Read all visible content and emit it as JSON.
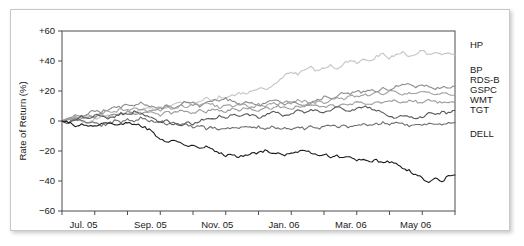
{
  "figure": {
    "background_color": "#ffffff",
    "frame_border_color": "#c8c8c8"
  },
  "chart_data": {
    "type": "line",
    "title": "",
    "subtitle": "",
    "xlabel": "",
    "ylabel": "Rate of Return (%)",
    "ylim": [
      -60,
      60
    ],
    "ytick_labels": [
      "+60",
      "+40",
      "+20",
      "0",
      "-20",
      "-40",
      "-60"
    ],
    "ytick_values": [
      60,
      40,
      20,
      0,
      -20,
      -40,
      -60
    ],
    "xtick_labels": [
      "Jul. 05",
      "Sep. 05",
      "Nov. 05",
      "Jan. 06",
      "Mar. 06",
      "May 06"
    ],
    "xtick_positions": [
      0.055,
      0.225,
      0.395,
      0.565,
      0.735,
      0.9
    ],
    "grid": false,
    "legend_position": "right",
    "x_count": 61,
    "series": [
      {
        "name": "HP",
        "color": "#c4c4c4",
        "legend_y": 48,
        "values": [
          0,
          1,
          2,
          0,
          -1,
          1,
          3,
          4,
          3,
          5,
          6,
          5,
          7,
          9,
          8,
          10,
          9,
          11,
          13,
          12,
          11,
          13,
          15,
          14,
          16,
          15,
          17,
          19,
          18,
          20,
          22,
          21,
          23,
          26,
          30,
          33,
          31,
          34,
          36,
          33,
          35,
          37,
          35,
          38,
          41,
          39,
          42,
          40,
          43,
          45,
          42,
          44,
          46,
          43,
          45,
          47,
          44,
          46,
          44,
          46,
          44
        ]
      },
      {
        "name": "BP",
        "color": "#8c8c8c",
        "legend_y": 73,
        "values": [
          0,
          2,
          4,
          3,
          5,
          7,
          6,
          8,
          10,
          9,
          11,
          10,
          12,
          11,
          9,
          8,
          10,
          9,
          11,
          13,
          12,
          10,
          12,
          14,
          13,
          15,
          13,
          11,
          13,
          12,
          10,
          12,
          14,
          13,
          11,
          13,
          12,
          10,
          12,
          14,
          16,
          15,
          17,
          19,
          18,
          20,
          19,
          21,
          20,
          22,
          21,
          23,
          25,
          24,
          22,
          24,
          23,
          21,
          23,
          22,
          23
        ]
      },
      {
        "name": "RDS-B",
        "color": "#a0a0a0",
        "legend_y": 83,
        "values": [
          0,
          1,
          3,
          2,
          4,
          3,
          5,
          7,
          6,
          8,
          7,
          9,
          8,
          6,
          8,
          7,
          9,
          8,
          10,
          9,
          11,
          10,
          12,
          11,
          9,
          11,
          10,
          12,
          11,
          9,
          11,
          10,
          12,
          11,
          13,
          12,
          14,
          13,
          11,
          13,
          12,
          14,
          16,
          15,
          17,
          16,
          18,
          17,
          19,
          18,
          20,
          19,
          17,
          19,
          18,
          20,
          19,
          17,
          19,
          18,
          17
        ]
      },
      {
        "name": "GSPC",
        "color": "#9a9a9a",
        "legend_y": 93,
        "values": [
          0,
          1,
          2,
          1,
          3,
          2,
          4,
          3,
          5,
          4,
          6,
          5,
          4,
          6,
          5,
          4,
          6,
          5,
          7,
          6,
          5,
          7,
          6,
          8,
          7,
          6,
          8,
          7,
          9,
          8,
          7,
          9,
          8,
          10,
          9,
          8,
          10,
          9,
          11,
          10,
          9,
          11,
          10,
          12,
          11,
          13,
          12,
          11,
          13,
          12,
          14,
          13,
          12,
          14,
          13,
          12,
          14,
          13,
          12,
          13,
          12
        ]
      },
      {
        "name": "WMT",
        "color": "#6e6e6e",
        "legend_y": 103,
        "values": [
          0,
          -1,
          1,
          0,
          -2,
          -1,
          -3,
          -2,
          0,
          -1,
          1,
          0,
          2,
          1,
          -1,
          0,
          -2,
          -1,
          -3,
          -2,
          -4,
          -3,
          -5,
          -4,
          -6,
          -5,
          -4,
          -5,
          -4,
          -5,
          -4,
          -5,
          -4,
          -5,
          -4,
          -5,
          -4,
          -5,
          -4,
          -5,
          -4,
          -3,
          -4,
          -3,
          -4,
          -3,
          -2,
          -3,
          -2,
          -1,
          -2,
          -1,
          -2,
          -3,
          -2,
          -3,
          -2,
          -3,
          -2,
          -1,
          -1
        ]
      },
      {
        "name": "TGT",
        "color": "#585858",
        "legend_y": 113,
        "values": [
          0,
          -2,
          1,
          3,
          2,
          4,
          3,
          1,
          3,
          5,
          4,
          6,
          5,
          3,
          1,
          -1,
          0,
          -2,
          -3,
          -1,
          -2,
          0,
          2,
          1,
          3,
          2,
          4,
          3,
          5,
          4,
          2,
          4,
          6,
          5,
          3,
          5,
          7,
          6,
          8,
          7,
          5,
          7,
          9,
          8,
          6,
          8,
          10,
          9,
          7,
          5,
          3,
          2,
          4,
          3,
          1,
          3,
          5,
          4,
          6,
          5,
          7
        ]
      },
      {
        "name": "DELL",
        "color": "#1c1c1c",
        "legend_y": 137,
        "values": [
          0,
          -1,
          -3,
          -2,
          -4,
          -3,
          -2,
          -1,
          -3,
          -2,
          -1,
          -2,
          -3,
          -5,
          -8,
          -12,
          -14,
          -13,
          -15,
          -17,
          -16,
          -18,
          -17,
          -19,
          -21,
          -23,
          -22,
          -24,
          -23,
          -22,
          -21,
          -20,
          -22,
          -21,
          -23,
          -22,
          -21,
          -19,
          -21,
          -23,
          -22,
          -24,
          -23,
          -25,
          -24,
          -26,
          -25,
          -27,
          -26,
          -28,
          -27,
          -29,
          -31,
          -33,
          -36,
          -38,
          -41,
          -38,
          -40,
          -37,
          -36
        ]
      }
    ]
  }
}
